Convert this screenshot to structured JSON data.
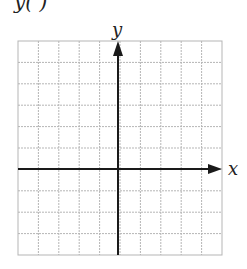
{
  "header": {
    "partial_label": "y( )"
  },
  "graph": {
    "x_axis_label": "x",
    "y_axis_label": "y",
    "grid": {
      "columns": 10,
      "rows": 10,
      "origin_col": 5,
      "origin_row": 6
    },
    "colors": {
      "grid": "#b5b5b5",
      "axis": "#1a1a1a"
    }
  }
}
